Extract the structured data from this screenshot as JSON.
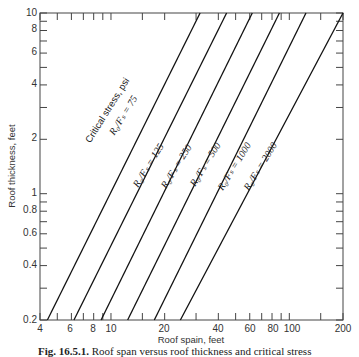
{
  "chart_data": {
    "type": "line",
    "title": "",
    "xlabel": "Roof spain, feet",
    "ylabel": "Roof thickness, feet",
    "xscale": "log",
    "yscale": "log",
    "xlim": [
      4,
      200
    ],
    "ylim": [
      0.2,
      10
    ],
    "grid": false,
    "x_tick_labels": [
      "4",
      "6",
      "8",
      "10",
      "20",
      "40",
      "60",
      "80",
      "100",
      "200"
    ],
    "x_ticks": [
      4,
      5,
      6,
      7,
      8,
      9,
      10,
      15,
      20,
      30,
      40,
      50,
      60,
      70,
      80,
      90,
      100,
      150,
      200
    ],
    "y_tick_labels": [
      "0.2",
      "0.4",
      "0.6",
      "0.8",
      "1",
      "2",
      "4",
      "6",
      "8",
      "10"
    ],
    "y_ticks": [
      0.2,
      0.3,
      0.4,
      0.5,
      0.6,
      0.7,
      0.8,
      0.9,
      1,
      2,
      3,
      4,
      5,
      6,
      7,
      8,
      9,
      10
    ],
    "legend": "inline labels along lines",
    "series_group_title": "Critical stress, psi",
    "series": [
      {
        "name": "R0/Fs = 75",
        "x": [
          4.4,
          31.6
        ],
        "y": [
          0.2,
          10
        ]
      },
      {
        "name": "R0/Fs = 125",
        "x": [
          6.2,
          44.5
        ],
        "y": [
          0.2,
          10
        ]
      },
      {
        "name": "R0/Fs = 250",
        "x": [
          8.8,
          62.0
        ],
        "y": [
          0.2,
          10
        ]
      },
      {
        "name": "R0/Fs = 500",
        "x": [
          12.4,
          88.0
        ],
        "y": [
          0.2,
          10
        ]
      },
      {
        "name": "R0/Fs = 1000",
        "x": [
          17.5,
          124.0
        ],
        "y": [
          0.2,
          10
        ]
      },
      {
        "name": "R0/Fs = 2000",
        "x": [
          24.5,
          200.0
        ],
        "y": [
          0.2,
          10
        ]
      }
    ]
  },
  "labels": {
    "group_title": "Critical stress, psi",
    "line_labels": [
      "R₀/Fₛ = 75",
      "R₀/Fₛ = 125",
      "R₀/Fₛ = 250",
      "R₀/Fₛ = 500",
      "R₀/Fₛ = 1000",
      "R₀/Fₛ = 2000"
    ],
    "xlabel": "Roof spain, feet",
    "ylabel": "Roof thickness, feet"
  },
  "ticks": {
    "x": [
      "4",
      "6",
      "8",
      "10",
      "20",
      "40",
      "60",
      "80",
      "100",
      "200"
    ],
    "y": [
      "0.2",
      "0.4",
      "0.6",
      "0.8",
      "1",
      "2",
      "4",
      "6",
      "8",
      "10"
    ]
  },
  "caption": {
    "fig": "Fig. 16.5.1.",
    "text": "Roof span versus roof thickness and critical stress"
  }
}
